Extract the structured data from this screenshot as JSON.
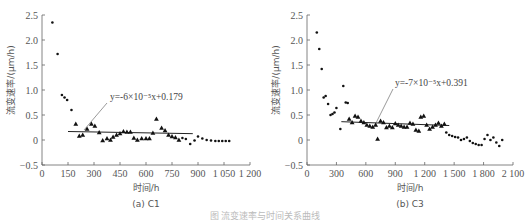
{
  "figure_caption": "图 流变速率与时间关系曲线",
  "chart_data": [
    {
      "type": "scatter",
      "panel": "(a) C1",
      "title": "",
      "xlabel": "时间/h",
      "ylabel": "流变速率/(μm/h)",
      "xlim": [
        0,
        1200
      ],
      "ylim": [
        -0.5,
        2.5
      ],
      "xticks": [
        "0",
        "150",
        "300",
        "450",
        "600",
        "750",
        "900",
        "1 050",
        "1 200"
      ],
      "yticks": [
        "-0.5",
        "0",
        "0.5",
        "1.0",
        "1.5",
        "2.0",
        "2.5"
      ],
      "grid": false,
      "fit": {
        "equation": "y=-6×10⁻⁵x+0.179",
        "slope": -6e-05,
        "intercept": 0.179,
        "x_range": [
          150,
          870
        ]
      },
      "series": [
        {
          "name": "dots_early",
          "marker": "dot",
          "x": [
            60,
            90,
            115,
            130,
            145,
            170
          ],
          "y": [
            2.35,
            1.72,
            0.9,
            0.85,
            0.8,
            0.6
          ]
        },
        {
          "name": "triangles_fit",
          "marker": "triangle",
          "x": [
            195,
            215,
            235,
            260,
            285,
            305,
            330,
            350,
            375,
            395,
            410,
            430,
            450,
            470,
            490,
            510,
            530,
            550,
            575,
            600,
            620,
            640,
            660,
            690,
            710,
            730,
            750,
            770,
            790
          ],
          "y": [
            0.32,
            0.08,
            0.1,
            0.22,
            0.32,
            0.28,
            0.15,
            -0.01,
            0.03,
            0.0,
            0.06,
            0.1,
            0.13,
            0.17,
            0.16,
            0.16,
            0.04,
            0.0,
            0.03,
            0.03,
            0.03,
            0.14,
            0.42,
            0.24,
            0.19,
            0.1,
            0.07,
            0.05,
            0.0
          ]
        },
        {
          "name": "dots_late",
          "marker": "dot",
          "x": [
            810,
            830,
            855,
            880,
            900,
            925,
            950,
            975,
            1000,
            1020,
            1040,
            1060,
            1080
          ],
          "y": [
            0.04,
            0.02,
            -0.08,
            -0.01,
            0.07,
            0.03,
            0.0,
            -0.01,
            -0.02,
            -0.02,
            -0.02,
            -0.02,
            -0.02
          ]
        }
      ]
    },
    {
      "type": "scatter",
      "panel": "(b) C3",
      "title": "",
      "xlabel": "时间/h",
      "ylabel": "流变速率/(μm/h)",
      "xlim": [
        0,
        2100
      ],
      "ylim": [
        -0.5,
        2.5
      ],
      "xticks": [
        "0",
        "300",
        "600",
        "900",
        "1 200",
        "1 500",
        "1 800",
        "2 100"
      ],
      "yticks": [
        "-0.5",
        "0",
        "0.5",
        "1.0",
        "1.5",
        "2.0",
        "2.5"
      ],
      "grid": false,
      "fit": {
        "equation": "y=-7×10⁻⁵x+0.391",
        "slope": -7e-05,
        "intercept": 0.391,
        "x_range": [
          350,
          1450
        ]
      },
      "series": [
        {
          "name": "dots_early",
          "marker": "dot",
          "x": [
            100,
            125,
            150,
            170,
            190,
            215,
            240,
            260,
            280,
            300,
            340,
            370,
            395,
            415
          ],
          "y": [
            2.15,
            1.82,
            1.42,
            0.85,
            0.88,
            0.72,
            0.5,
            0.52,
            0.55,
            0.64,
            0.22,
            1.08,
            0.75,
            0.74
          ]
        },
        {
          "name": "triangles_fit",
          "marker": "triangle",
          "x": [
            430,
            460,
            490,
            520,
            550,
            580,
            610,
            640,
            670,
            700,
            720,
            750,
            780,
            810,
            840,
            870,
            900,
            930,
            960,
            990,
            1020,
            1050,
            1080,
            1110,
            1140,
            1160,
            1190,
            1220,
            1250,
            1280,
            1310,
            1340,
            1370,
            1400
          ],
          "y": [
            0.42,
            0.35,
            0.48,
            0.46,
            0.38,
            0.35,
            0.3,
            0.28,
            0.26,
            0.3,
            0.02,
            0.38,
            0.35,
            0.25,
            0.28,
            0.25,
            0.33,
            0.3,
            0.28,
            0.26,
            0.26,
            0.34,
            0.32,
            0.2,
            0.18,
            0.46,
            0.48,
            0.3,
            0.22,
            0.26,
            0.3,
            0.34,
            0.28,
            0.32
          ]
        },
        {
          "name": "dots_late",
          "marker": "dot",
          "x": [
            1420,
            1450,
            1480,
            1510,
            1540,
            1570,
            1600,
            1630,
            1660,
            1690,
            1720,
            1750,
            1780,
            1810,
            1840,
            1870,
            1900,
            1930,
            1960,
            1990
          ],
          "y": [
            0.15,
            0.1,
            0.08,
            0.06,
            0.05,
            0.0,
            0.02,
            0.05,
            -0.02,
            -0.06,
            -0.08,
            -0.1,
            -0.1,
            0.02,
            0.1,
            0.0,
            0.05,
            -0.05,
            -0.12,
            0.0
          ]
        }
      ]
    }
  ]
}
